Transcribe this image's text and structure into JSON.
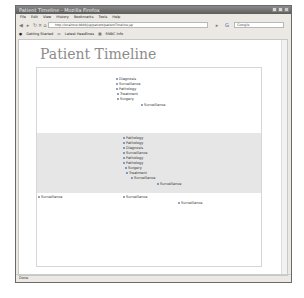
{
  "window": {
    "title": "Patient Timeline - Mozilla Firefox"
  },
  "menubar": [
    "File",
    "Edit",
    "View",
    "History",
    "Bookmarks",
    "Tools",
    "Help"
  ],
  "navbar": {
    "url": "http://localhost:8080/jsp/patient/patientTimeline.jsp",
    "search_placeholder": "Google"
  },
  "bookmarks": [
    "Getting Started",
    "Latest Headlines",
    "RNBC Info"
  ],
  "page": {
    "title": "Patient Timeline"
  },
  "timeline": {
    "bands": [
      {
        "name": "top",
        "color": "#ffffff"
      },
      {
        "name": "middle",
        "color": "#e6e6e6"
      },
      {
        "name": "bottom",
        "color": "#ffffff"
      }
    ],
    "events_top": [
      "Diagnosis",
      "Surveillance",
      "Pathology",
      "Treatment",
      "Surgery",
      "Surveillance"
    ],
    "events_middle": [
      "Pathology",
      "Pathology",
      "Diagnosis",
      "Surveillance",
      "Pathology",
      "Pathology",
      "Surgery",
      "Treatment",
      "Surveillance",
      "Surveillance"
    ],
    "events_bottom": [
      "Surveillance",
      "Surveillance",
      "Surveillance"
    ]
  },
  "statusbar": {
    "text": "Done"
  }
}
